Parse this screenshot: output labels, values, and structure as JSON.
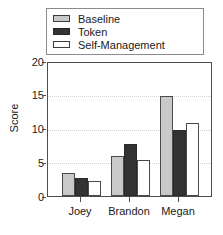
{
  "chart_data": {
    "type": "bar",
    "title": "",
    "xlabel": "",
    "ylabel": "Score",
    "ylim": [
      0,
      20
    ],
    "yticks": [
      0,
      5,
      10,
      15,
      20
    ],
    "grid": true,
    "legend_position": "top",
    "categories": [
      "Joey",
      "Brandon",
      "Megan"
    ],
    "series": [
      {
        "name": "Baseline",
        "color": "#c9c9c9",
        "values": [
          3.5,
          6.0,
          15.0
        ]
      },
      {
        "name": "Token",
        "color": "#333333",
        "values": [
          2.7,
          7.8,
          10.0
        ]
      },
      {
        "name": "Self-Management",
        "color": "#ffffff",
        "values": [
          2.2,
          5.4,
          11.0
        ]
      }
    ]
  },
  "legend": {
    "items": [
      {
        "label": "Baseline"
      },
      {
        "label": "Token"
      },
      {
        "label": "Self-Management"
      }
    ]
  },
  "axes": {
    "y": {
      "title": "Score",
      "tick_labels": [
        "20",
        "15",
        "10",
        "5",
        "0"
      ]
    },
    "x": {
      "tick_labels": [
        "Joey",
        "Brandon",
        "Megan"
      ]
    }
  }
}
